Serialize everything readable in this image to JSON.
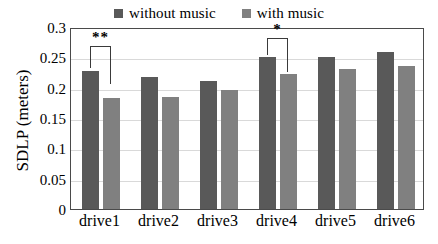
{
  "chart_data": {
    "type": "bar",
    "title": "",
    "xlabel": "",
    "ylabel": "SDLP (meters)",
    "categories": [
      "drive1",
      "drive2",
      "drive3",
      "drive4",
      "drive5",
      "drive6"
    ],
    "series": [
      {
        "name": "without music",
        "color": "#595959",
        "values": [
          0.228,
          0.217,
          0.211,
          0.251,
          0.25,
          0.259
        ]
      },
      {
        "name": "with music",
        "color": "#808080",
        "values": [
          0.183,
          0.184,
          0.197,
          0.222,
          0.23,
          0.235
        ]
      }
    ],
    "ylim": [
      0,
      0.3
    ],
    "yticks": [
      0,
      0.05,
      0.1,
      0.15,
      0.2,
      0.25,
      0.3
    ],
    "ytick_labels": [
      "0",
      "0.05",
      "0.1",
      "0.15",
      "0.2",
      "0.25",
      "0.3"
    ],
    "grid": true,
    "grid_axis": "y",
    "legend_position": "top-center",
    "annotations": [
      {
        "category": "drive1",
        "text": "**",
        "bracket_top_value": 0.272,
        "left_drop_value": 0.235,
        "right_drop_value": 0.209
      },
      {
        "category": "drive4",
        "text": "*",
        "bracket_top_value": 0.285,
        "left_drop_value": 0.257,
        "right_drop_value": 0.229
      }
    ]
  },
  "legend": {
    "entries": [
      {
        "label": "without music",
        "swatch": "#595959"
      },
      {
        "label": "with music",
        "swatch": "#808080"
      }
    ]
  },
  "axes": {
    "y_title": "SDLP (meters)"
  },
  "colors": {
    "series_without_music": "#595959",
    "series_with_music": "#808080",
    "gridline": "#d9d9d9",
    "frame": "#4a4a4a",
    "background": "#ffffff"
  }
}
